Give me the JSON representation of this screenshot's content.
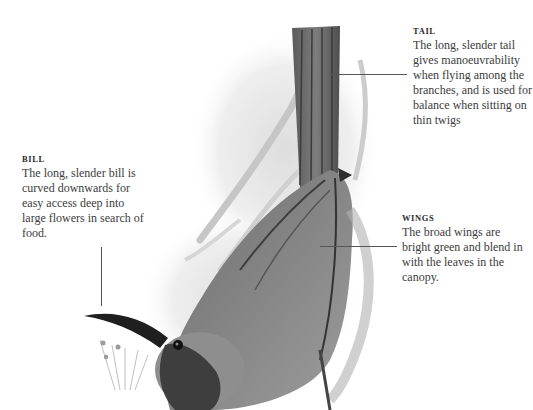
{
  "annotations": {
    "tail": {
      "title": "TAIL",
      "body": "The long, slender tail gives manoeuvrability when flying among the branches, and is used for balance when sitting on thin twigs"
    },
    "bill": {
      "title": "BILL",
      "body": "The long, slender bill is curved downwards for easy access deep into large flowers in search of food."
    },
    "wings": {
      "title": "WINGS",
      "body": "The broad wings are bright green and blend in with the leaves in the canopy."
    }
  },
  "illustration": {
    "subject": "bird-illustration",
    "style": "monochrome engraving"
  }
}
